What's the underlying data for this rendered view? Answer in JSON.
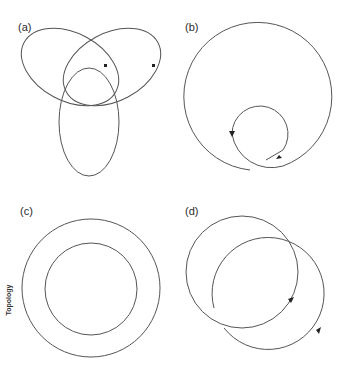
{
  "figure": {
    "panels": [
      {
        "id": "a",
        "label": "(a)",
        "description": "Trefoil-like arrangement of three interlocking loops"
      },
      {
        "id": "b",
        "label": "(b)",
        "description": "Large open loop with inner curl and direction arrows"
      },
      {
        "id": "c",
        "label": "(c)",
        "description": "Two concentric circles"
      },
      {
        "id": "d",
        "label": "(d)",
        "description": "Two overlapping loops with direction arrows"
      }
    ],
    "side_label": "Topology",
    "stroke_color": "#555555",
    "background": "#ffffff"
  }
}
